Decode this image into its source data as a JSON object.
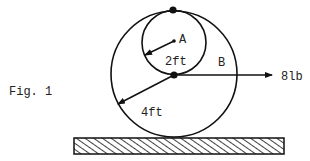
{
  "figure": {
    "caption": "Fig. 1",
    "labels": {
      "inner_point": "A",
      "outer_region": "B",
      "inner_radius": "2ft",
      "outer_radius": "4ft",
      "force": "8lb"
    },
    "colors": {
      "line": "#111111",
      "text": "#222222",
      "background": "#ffffff"
    }
  }
}
